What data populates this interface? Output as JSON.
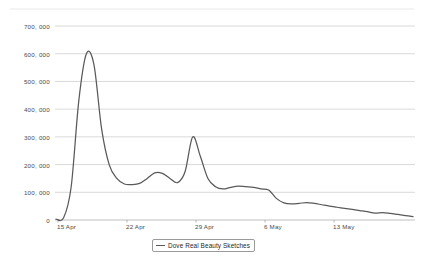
{
  "chart_data": {
    "type": "line",
    "title": "",
    "xlabel": "",
    "ylabel": "",
    "grid": true,
    "legend_position": "bottom-center",
    "ylim": [
      0,
      700000
    ],
    "ytick_labels": [
      "700, 000",
      "600, 000",
      "500, 000",
      "400, 000",
      "300, 000",
      "200, 000",
      "100, 000",
      "0"
    ],
    "ytick_values": [
      700000,
      600000,
      500000,
      400000,
      300000,
      200000,
      100000,
      0
    ],
    "xtick_labels": [
      "15 Apr",
      "22 Apr",
      "29 Apr",
      "6 May",
      "13 May"
    ],
    "series": [
      {
        "name": "Dove Real Beauty Sketches",
        "color": "#595959",
        "x": [
          "14 Apr",
          "15 Apr",
          "15 Apr+",
          "16 Apr",
          "16 Apr+",
          "17 Apr",
          "17 Apr+",
          "18 Apr",
          "18 Apr+",
          "19 Apr",
          "19 Apr+",
          "20 Apr",
          "20 Apr+",
          "21 Apr",
          "21 Apr+",
          "22 Apr",
          "22 Apr+",
          "23 Apr",
          "23 Apr+",
          "24 Apr",
          "24 Apr+",
          "25 Apr",
          "25 Apr+",
          "26 Apr",
          "26 Apr+",
          "27 Apr",
          "27 Apr+",
          "28 Apr",
          "29 Apr",
          "30 Apr",
          "1 May",
          "2 May",
          "3 May",
          "4 May",
          "5 May",
          "6 May",
          "7 May",
          "8 May",
          "9 May",
          "10 May",
          "11 May",
          "12 May",
          "13 May",
          "14 May",
          "15 May",
          "16 May",
          "17 May",
          "18 May"
        ],
        "values": [
          3000,
          8000,
          120000,
          430000,
          600000,
          560000,
          330000,
          200000,
          150000,
          130000,
          128000,
          132000,
          150000,
          170000,
          168000,
          150000,
          135000,
          175000,
          300000,
          230000,
          150000,
          120000,
          112000,
          118000,
          122000,
          120000,
          118000,
          112000,
          108000,
          78000,
          62000,
          58000,
          60000,
          63000,
          60000,
          55000,
          50000,
          46000,
          42000,
          38000,
          34000,
          30000,
          25000,
          27000,
          24000,
          20000,
          16000,
          12000
        ]
      }
    ]
  },
  "legend": {
    "entries": [
      {
        "label": "Dove Real Beauty Sketches"
      }
    ]
  }
}
